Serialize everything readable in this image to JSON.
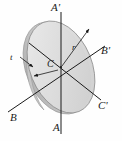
{
  "figure": {
    "kind": "engineering-diagram",
    "background_color": "#ffffff",
    "line_color": "#1a1a1a",
    "disk": {
      "face_fill": "#d9d9d9",
      "face_fill_light": "#ebebeb",
      "edge_fill": "#c2c2c2",
      "outline_color": "#8f8f8f",
      "center_x": 61,
      "center_y": 67,
      "radius_x": 31,
      "radius_y": 48,
      "tilt_deg": -22,
      "thickness_px": 5
    },
    "axes": [
      {
        "name": "A-A'",
        "orientation": "vertical",
        "start_label": "A",
        "end_label": "A'",
        "x1": 61,
        "y1": 134,
        "x2": 61,
        "y2": 12
      },
      {
        "name": "B-B'",
        "orientation": "diagonal-lower-left-to-upper-right",
        "start_label": "B",
        "end_label": "B'",
        "x1": 9,
        "y1": 111,
        "x2": 104,
        "y2": 47
      },
      {
        "name": "C-C'",
        "orientation": "diagonal-upper-left-to-lower-right",
        "start_label": "C'",
        "end_label": "C'",
        "x1": 30,
        "y1": 44,
        "x2": 100,
        "y2": 99
      }
    ],
    "labels": {
      "axis_a": "A",
      "axis_a_prime": "A'",
      "axis_b": "B",
      "axis_b_prime": "B'",
      "axis_c_prime": "C'",
      "center": "C",
      "thickness": "t",
      "radius": "r"
    },
    "leaders": {
      "thickness_arrow": {
        "from_x": 21,
        "from_y": 58,
        "to_x": 33,
        "to_y": 66,
        "meaning": "points to disk side face (thickness)"
      },
      "center_arrow": {
        "from_x": 59,
        "from_y": 69,
        "to_x": 35,
        "to_y": 75,
        "meaning": "points from center C to disk edge"
      },
      "radius_arrow": {
        "from_x": 61,
        "from_y": 67,
        "to_x": 88,
        "to_y": 30,
        "meaning": "radius r from center C to rim"
      }
    }
  }
}
